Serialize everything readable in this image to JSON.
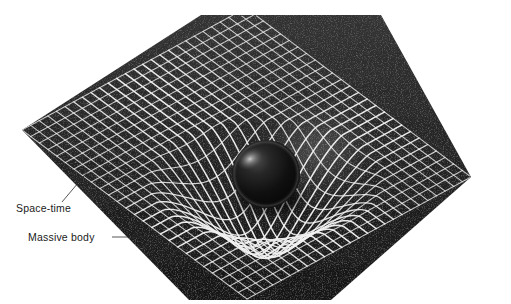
{
  "figure": {
    "background_color": "#ffffff",
    "grid_cell_color": "#2a2a2a",
    "grid_line_color": "#f2f2f2",
    "sphere_color": "#0d0d0d",
    "sphere_highlight_color": "#8f8f8f",
    "glow_color": "#b9b9b9"
  },
  "labels": {
    "spacetime": {
      "text": "Space-time",
      "x": 16,
      "y": 212,
      "leader": {
        "x1": 62,
        "y1": 202,
        "x2": 89,
        "y2": 170
      }
    },
    "massive_body": {
      "text": "Massive body",
      "x": 28,
      "y": 241,
      "leader": {
        "x1": 112,
        "y1": 237,
        "x2": 147,
        "y2": 237
      }
    }
  },
  "grid": {
    "shape": "hexagonal-diamond",
    "corners": {
      "top_left": {
        "x": 201,
        "y": 15
      },
      "top_right": {
        "x": 381,
        "y": 15
      },
      "right": {
        "x": 471,
        "y": 177
      },
      "bottom_right": {
        "x": 331,
        "y": 300
      },
      "bottom_left": {
        "x": 189,
        "y": 300
      },
      "left": {
        "x": 22,
        "y": 130
      }
    },
    "u_divisions": 26,
    "v_divisions": 26,
    "line_width_px": 1.15
  },
  "well": {
    "center_x": 266,
    "center_y": 181,
    "radius": 118,
    "depth": 74,
    "description": "gravitational potential well funnel"
  },
  "sphere": {
    "center_x": 266,
    "center_y": 174,
    "radius": 34,
    "highlight_x": 250,
    "highlight_y": 159,
    "highlight_radius": 11
  },
  "glow": {
    "center_x": 318,
    "center_y": 150,
    "radius_x": 58,
    "radius_y": 46,
    "opacity": 0.42
  }
}
